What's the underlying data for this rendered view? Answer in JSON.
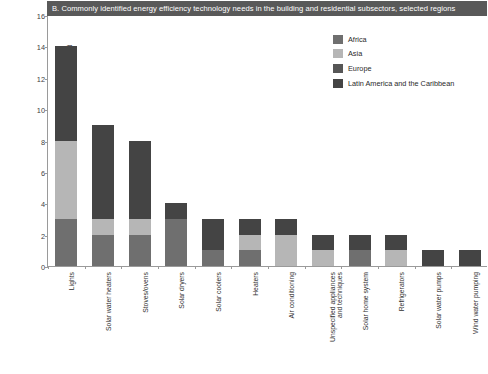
{
  "chart_data": {
    "type": "bar",
    "subtype": "stacked-bar",
    "title": "B. Commonly identified energy efficiency technology needs in the building and residential subsectors, selected regions",
    "xlabel": "",
    "ylabel": "Number of technologies identified",
    "ylim": [
      0,
      16
    ],
    "yticks": [
      0,
      2,
      4,
      6,
      8,
      10,
      12,
      14,
      16
    ],
    "grid": false,
    "legend_position": "top-right",
    "categories": [
      "Lights",
      "Solar water heaters",
      "Stoves/ovens",
      "Solar dryers",
      "Solar coolers",
      "Heaters",
      "Air conditioning",
      "Unspecified appliances and techniques",
      "Solar home system",
      "Refrigerators",
      "Solar water pumps",
      "Wind water pumping"
    ],
    "series": [
      {
        "name": "Africa",
        "color": "#6f6f6f",
        "values": [
          3,
          2,
          2,
          3,
          1,
          1,
          0,
          0,
          1,
          0,
          0,
          0
        ]
      },
      {
        "name": "Asia",
        "color": "#b6b6b6",
        "values": [
          5,
          1,
          1,
          0,
          0,
          1,
          2,
          1,
          0,
          1,
          0,
          0
        ]
      },
      {
        "name": "Europe",
        "color": "#565656",
        "values": [
          0,
          0,
          0,
          0,
          0,
          0,
          0,
          0,
          0,
          0,
          0,
          0
        ]
      },
      {
        "name": "Latin America and the Caribbean",
        "color": "#444444",
        "values": [
          6,
          6,
          5,
          1,
          2,
          1,
          1,
          1,
          1,
          1,
          1,
          1
        ]
      }
    ],
    "totals": [
      14,
      9,
      8,
      4,
      3,
      3,
      3,
      2,
      2,
      2,
      1,
      1
    ]
  },
  "legend": {
    "items": [
      {
        "label": "Africa"
      },
      {
        "label": "Asia"
      },
      {
        "label": "Europe"
      },
      {
        "label": "Latin America and the Caribbean"
      }
    ]
  },
  "colors": {
    "africa": "#6f6f6f",
    "asia": "#b6b6b6",
    "europe": "#565656",
    "latin_america": "#444444",
    "title_bar": "#595959",
    "axis": "#9a9a9a"
  }
}
